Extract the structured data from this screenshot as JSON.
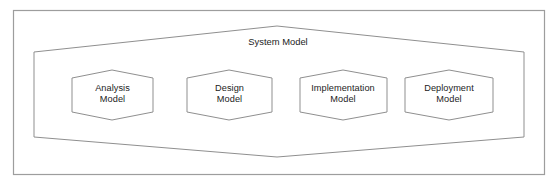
{
  "figure": {
    "type": "uml-package-diagram",
    "background_color": "#ffffff",
    "stroke_color": "#8f8f8f",
    "frame_color": "#9d9d9d",
    "text_color": "#232323"
  },
  "frame": {
    "name": "outer-border"
  },
  "system_model": {
    "title_line1": "System",
    "title_line2": "Model",
    "shape": "hexagon"
  },
  "models": [
    {
      "id": "analysis-model",
      "line1": "Analysis",
      "line2": "Model",
      "shape": "hexagon"
    },
    {
      "id": "design-model",
      "line1": "Design",
      "line2": "Model",
      "shape": "hexagon"
    },
    {
      "id": "implementation-model",
      "line1": "Implementation",
      "line2": "Model",
      "shape": "hexagon"
    },
    {
      "id": "deployment-model",
      "line1": "Deployment",
      "line2": "Model",
      "shape": "hexagon"
    }
  ]
}
